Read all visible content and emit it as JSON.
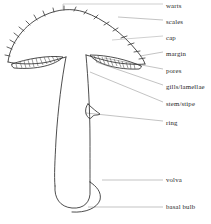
{
  "diagram": {
    "style": "line-art line drawing with leader lines",
    "background_color": "#ffffff",
    "line_color": "#333333",
    "leader_color": "#8c8c8c",
    "text_color": "#262626",
    "labels": [
      {
        "id": "warts",
        "text": "warts",
        "x": 166,
        "y": 2,
        "leader": "bracket"
      },
      {
        "id": "scales",
        "text": "scales",
        "x": 166,
        "y": 18,
        "leader": "angled"
      },
      {
        "id": "cap",
        "text": "cap",
        "x": 166,
        "y": 34,
        "leader": "horizontal"
      },
      {
        "id": "margin",
        "text": "margin",
        "x": 166,
        "y": 50,
        "leader": "angled"
      },
      {
        "id": "pores",
        "text": "pores",
        "x": 166,
        "y": 67,
        "leader": "angled"
      },
      {
        "id": "gills-lamellae",
        "text": "gills/lamellae",
        "x": 166,
        "y": 83,
        "leader": "angled"
      },
      {
        "id": "stem-stipe",
        "text": "stem/stipe",
        "x": 166,
        "y": 100,
        "leader": "angled"
      },
      {
        "id": "ring",
        "text": "ring",
        "x": 166,
        "y": 119,
        "leader": "angled"
      },
      {
        "id": "volva",
        "text": "volva",
        "x": 166,
        "y": 176,
        "leader": "horizontal"
      },
      {
        "id": "basal-bulb",
        "text": "basal bulb",
        "x": 166,
        "y": 203,
        "leader": "horizontal"
      }
    ],
    "parts": {
      "cap": "domed cap with wart projections along the rim",
      "gills": "two hatched lens-shaped gill regions beneath the cap",
      "stem": "tapered vertical stipe",
      "ring": "wavy annulus skirt on right of stem",
      "volva": "curved flap at the swollen base",
      "basal_bulb": "rounded swelling at stem base"
    }
  }
}
